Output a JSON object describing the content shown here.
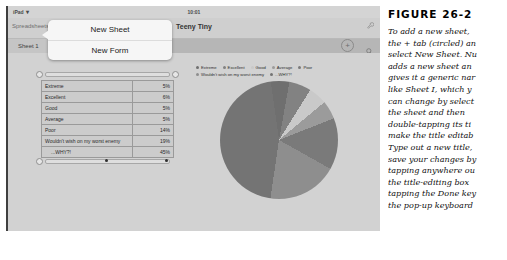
{
  "device": {
    "status_bar": {
      "device_label": "iPad",
      "wifi_icon": "wifi-icon",
      "time": "10:01"
    },
    "nav_bar": {
      "back_label": "Spreadsheets",
      "doc_title": "Teeny Tiny",
      "icons": [
        "wrench-icon",
        "plus-icon",
        "tools-icon",
        "share-icon"
      ]
    },
    "tab_bar": {
      "tabs": [
        {
          "label": "Sheet 1",
          "active": true
        },
        {
          "label": "Table 1",
          "active": false
        }
      ],
      "add_tab_label": "+",
      "search_icon": "search-icon"
    },
    "popover": {
      "items": [
        {
          "label": "New Sheet"
        },
        {
          "label": "New Form"
        }
      ]
    }
  },
  "table": {
    "rows": [
      {
        "label": "Extreme",
        "value": "5%"
      },
      {
        "label": "Excellent",
        "value": "6%"
      },
      {
        "label": "Good",
        "value": "5%"
      },
      {
        "label": "Average",
        "value": "5%"
      },
      {
        "label": "Poor",
        "value": "14%"
      },
      {
        "label": "Wouldn't wish on my worst enemy",
        "value": "19%"
      },
      {
        "label": "...WHY?!",
        "value": "45%"
      }
    ]
  },
  "chart_data": {
    "type": "pie",
    "title": "",
    "categories": [
      "Extreme",
      "Excellent",
      "Good",
      "Average",
      "Poor",
      "Wouldn't wish on my worst enemy",
      "...WHY?!"
    ],
    "values": [
      5,
      6,
      5,
      5,
      14,
      19,
      45
    ],
    "unit": "%",
    "legend_position": "top",
    "grid": false,
    "colors": [
      "#6f6f6f",
      "#828282",
      "#c9c9c9",
      "#9b9b9b",
      "#7a7a7a",
      "#8e8e8e",
      "#747474"
    ]
  },
  "caption": {
    "figure_number": "FIGURE 26-2",
    "lines": [
      "To add a new sheet,",
      "the + tab (circled) an",
      "select New Sheet. Nu",
      "adds a new sheet an",
      "gives it a generic nar",
      "like Sheet I, which y",
      "can change by select",
      "the sheet and then",
      "double-tapping its ti",
      "make the title editab",
      "Type out a new title,",
      "save your changes by",
      "tapping anywhere ou",
      "the title-editing box",
      "tapping the Done key",
      "the pop-up keyboard"
    ]
  }
}
